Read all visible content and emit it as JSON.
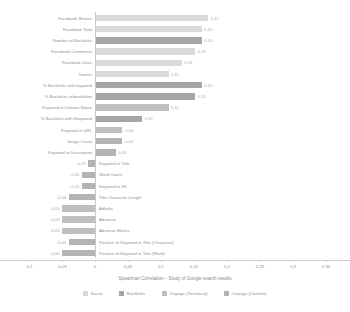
{
  "chart_data": {
    "type": "bar",
    "orientation": "horizontal",
    "title": "",
    "xlabel": "Spearman Correlation – Study of Google search results",
    "ylabel": "",
    "xlim": [
      -0.1,
      0.35
    ],
    "xticks": [
      -0.1,
      -0.05,
      0,
      0.05,
      0.1,
      0.15,
      0.2,
      0.25,
      0.3,
      0.35
    ],
    "xtick_labels": [
      "-0,1",
      "-0,05",
      "0",
      "0,05",
      "0,1",
      "0,15",
      "0,2",
      "0,25",
      "0,3",
      "0,35"
    ],
    "grid": false,
    "legend_position": "bottom",
    "categories": [
      "Facebook Shares",
      "Facebook Total",
      "Number of Backlinks",
      "Facebook Comments",
      "Facebook Likes",
      "Tweets",
      "% Backlinks with keyword",
      "% Backlinks rel=nofollow",
      "Keyword in Domain Name",
      "% Backlinks with Stopword",
      "Keyword in URL",
      "Image Count",
      "Keyword in Description",
      "Keyword in Title",
      "Word Count",
      "Keyword in H1",
      "Title Character Length",
      "Adlinks",
      "Adsense",
      "Adsense Blocks",
      "Position of Keyword in Title (Character)",
      "Position of Keyword in Title (Word)"
    ],
    "values": [
      0.17,
      0.16,
      0.16,
      0.15,
      0.13,
      0.11,
      0.16,
      0.15,
      0.11,
      0.07,
      0.04,
      0.04,
      0.03,
      -0.01,
      -0.02,
      -0.02,
      -0.04,
      -0.05,
      -0.05,
      -0.05,
      -0.04,
      -0.05
    ],
    "value_labels": [
      "0,17",
      "0,16",
      "0,16",
      "0,15",
      "0,13",
      "0,11",
      "0,16",
      "0,15",
      "0,11",
      "0,07",
      "0,04",
      "0,04",
      "0,03",
      "-0,01",
      "-0,02",
      "-0,02",
      "-0,04",
      "-0,05",
      "-0,05",
      "-0,05",
      "-0,04",
      "-0,05"
    ],
    "groups": [
      "Social",
      "Social",
      "Backlinks",
      "Social",
      "Social",
      "Social",
      "Backlinks",
      "Backlinks",
      "Onpage (Technical)",
      "Backlinks",
      "Onpage (Technical)",
      "Onpage (Content)",
      "Onpage (Content)",
      "Onpage (Content)",
      "Onpage (Content)",
      "Onpage (Content)",
      "Onpage (Content)",
      "Onpage (Technical)",
      "Onpage (Technical)",
      "Onpage (Technical)",
      "Onpage (Content)",
      "Onpage (Content)"
    ],
    "series": [
      {
        "name": "Social",
        "color": "#d9d9d9"
      },
      {
        "name": "Backlinks",
        "color": "#a6a6a6"
      },
      {
        "name": "Onpage (Technical)",
        "color": "#bfbfbf"
      },
      {
        "name": "Onpage (Content)",
        "color": "#b3b3b3"
      }
    ]
  },
  "legend": {
    "items": [
      {
        "label": "Social",
        "color": "#d9d9d9"
      },
      {
        "label": "Backlinks",
        "color": "#a6a6a6"
      },
      {
        "label": "Onpage (Technical)",
        "color": "#bfbfbf"
      },
      {
        "label": "Onpage (Content)",
        "color": "#b3b3b3"
      }
    ]
  }
}
